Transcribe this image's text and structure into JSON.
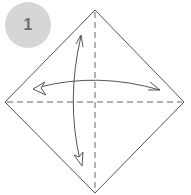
{
  "step": {
    "number": "1",
    "badge_color": "#d6d6d6",
    "text_color": "#6e6e6e"
  },
  "diagram": {
    "paper_shape": "square rotated 45 degrees (diamond)",
    "line_color": "#555555",
    "fold_lines": [
      {
        "type": "valley-dashed",
        "orientation": "vertical",
        "from": [
          95,
          10
        ],
        "to": [
          95,
          193
        ]
      },
      {
        "type": "valley-dashed",
        "orientation": "horizontal",
        "from": [
          5,
          102
        ],
        "to": [
          184,
          102
        ]
      }
    ],
    "arrows": [
      {
        "name": "fold-and-unfold-horizontal",
        "direction": "left-right double-headed"
      },
      {
        "name": "fold-and-unfold-vertical",
        "direction": "up-down double-headed"
      }
    ]
  }
}
